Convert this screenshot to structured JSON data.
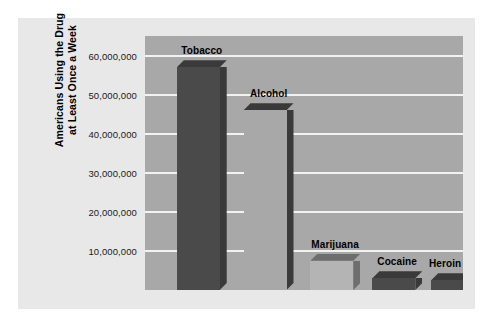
{
  "chart_data": {
    "type": "bar",
    "title": "",
    "subtitle": "",
    "xlabel": "",
    "ylabel_lines": [
      "Americans Using the Drug",
      "at Least Once a Week"
    ],
    "ylabel": "Americans Using the Drug at Least Once a Week",
    "categories": [
      "Tobacco",
      "Alcohol",
      "Marijuana",
      "Cocaine",
      "Heroin"
    ],
    "values": [
      57000000,
      46000000,
      7500000,
      3000000,
      2500000
    ],
    "ylim": [
      0,
      65000000
    ],
    "ytick_values": [
      10000000,
      20000000,
      30000000,
      40000000,
      50000000,
      60000000
    ],
    "ytick_labels": [
      "10,000,000",
      "20,000,000",
      "30,000,000",
      "40,000,000",
      "50,000,000",
      "60,000,000"
    ],
    "grid": true,
    "legend": "none",
    "style": "3d-bars",
    "colors": {
      "plot_background": "#a8a8a8",
      "panel_background": "#e8e8e8",
      "figure_background": "#ffffff",
      "gridline": "#f2f2f2",
      "bar_dark": "#4a4a4a",
      "bar_light": "#b4b4b4",
      "bar_side_dark": "#3a3a3a",
      "bar_side_medium": "#6e6e6e",
      "text": "#000000"
    },
    "bars": [
      {
        "label": "Tobacco",
        "value": 57000000,
        "face": "dark",
        "x_pct": 10.0,
        "width_pct": 13.5
      },
      {
        "label": "Alcohol",
        "value": 46000000,
        "face": "plot",
        "x_pct": 31.0,
        "width_pct": 13.5
      },
      {
        "label": "Marijuana",
        "value": 7500000,
        "face": "light",
        "x_pct": 52.0,
        "width_pct": 13.5
      },
      {
        "label": "Cocaine",
        "value": 3000000,
        "face": "dark",
        "x_pct": 71.5,
        "width_pct": 13.5
      },
      {
        "label": "Heroin",
        "value": 2500000,
        "face": "dark",
        "x_pct": 90.0,
        "width_pct": 13.5
      }
    ]
  }
}
